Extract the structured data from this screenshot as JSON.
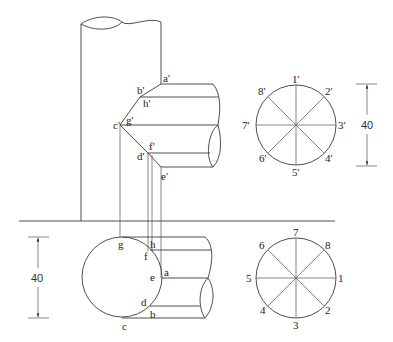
{
  "diagram": {
    "type": "orthographic-projection",
    "front_view": {
      "points": [
        "a'",
        "b'",
        "h'",
        "c'",
        "g'",
        "f'",
        "d'",
        "e'"
      ]
    },
    "top_view": {
      "points": [
        "g",
        "h",
        "f",
        "e",
        "a",
        "d",
        "b",
        "c"
      ]
    },
    "aux_circle_front": {
      "labels": [
        "1'",
        "2'",
        "3'",
        "4'",
        "5'",
        "6'",
        "7'",
        "8'"
      ]
    },
    "aux_circle_top": {
      "labels": [
        "1",
        "2",
        "3",
        "4",
        "5",
        "6",
        "7",
        "8"
      ]
    },
    "dimensions": {
      "front_right": "40",
      "top_left": "40"
    }
  }
}
